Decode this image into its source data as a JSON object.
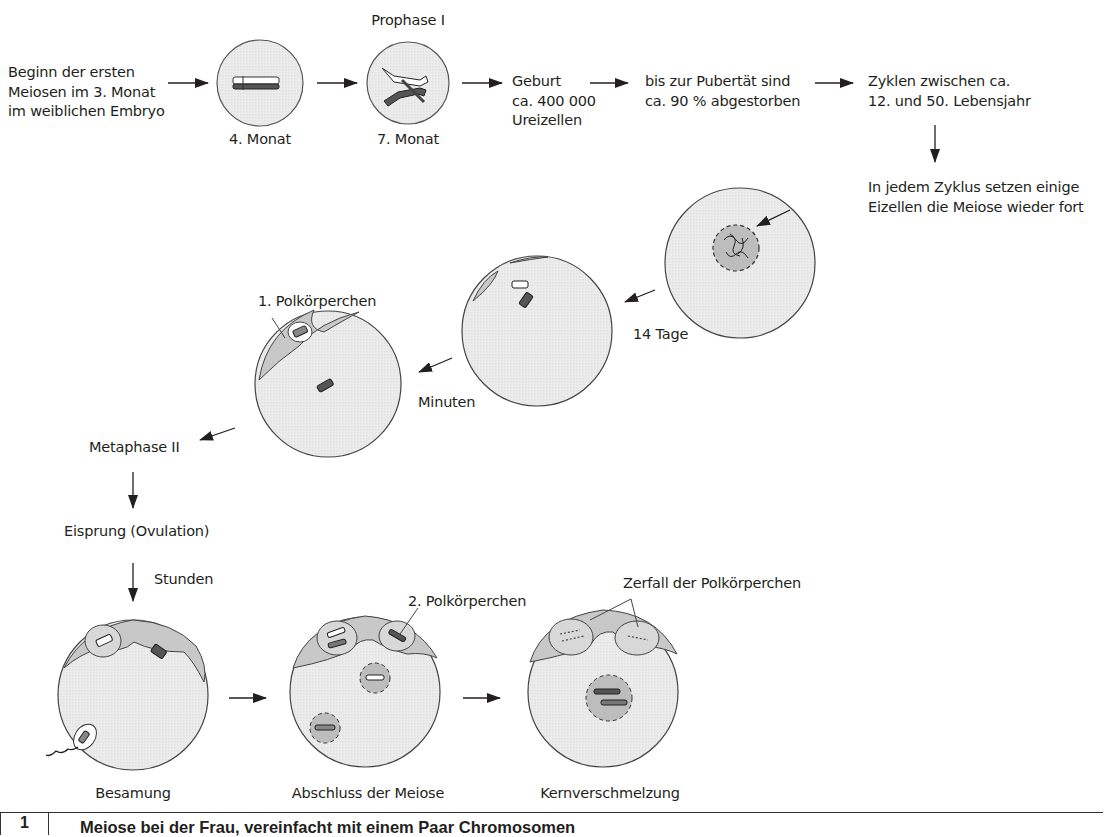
{
  "figure": {
    "number": "1",
    "caption": "Meiose bei der Frau, vereinfacht mit einem Paar Chromosomen"
  },
  "row1": {
    "start": [
      "Beginn der ersten",
      "Meiosen im 3. Monat",
      "im weiblichen Embryo"
    ],
    "cell1_label": "4. Monat",
    "cell2_title": "Prophase I",
    "cell2_label": "7. Monat",
    "birth": [
      "Geburt",
      "ca. 400 000",
      "Ureizellen"
    ],
    "puberty": [
      "bis zur Pubertät sind",
      "ca. 90 % abgestorben"
    ],
    "cycles": [
      "Zyklen zwischen ca.",
      "12. und 50. Lebensjahr"
    ]
  },
  "row2": {
    "resume": [
      "In jedem Zyklus setzen einige",
      "Eizellen die Meiose wieder fort"
    ],
    "days": "14 Tage",
    "minutes": "Minuten",
    "polar_body_1": "1. Polkörperchen",
    "metaphase": "Metaphase II",
    "ovulation": "Eisprung (Ovulation)",
    "hours": "Stunden"
  },
  "row3": {
    "polar_body_2": "2. Polkörperchen",
    "polar_decay": "Zerfall der Polkörperchen",
    "stage1": "Besamung",
    "stage2": "Abschluss der Meiose",
    "stage3": "Kernverschmelzung"
  },
  "colors": {
    "ink": "#231f20",
    "cell_fill": "#ececec",
    "cap_fill": "#c8c8c8",
    "nucleus_fill": "#bdbdbd"
  }
}
